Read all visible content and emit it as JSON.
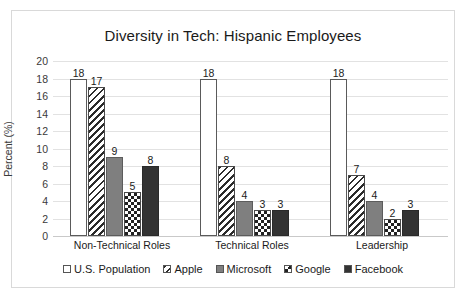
{
  "chart_data": {
    "type": "bar",
    "title": "Diversity in Tech: Hispanic Employees",
    "xlabel": "",
    "ylabel": "Percent (%)",
    "ylim": [
      0,
      20
    ],
    "ytick_step": 2,
    "yticks": [
      "20",
      "18",
      "16",
      "14",
      "12",
      "10",
      "8",
      "6",
      "4",
      "2",
      "0"
    ],
    "grid": true,
    "legend_position": "bottom",
    "categories": [
      "Non-Technical Roles",
      "Technical Roles",
      "Leadership"
    ],
    "series": [
      {
        "name": "U.S. Population",
        "values": [
          18,
          18,
          18
        ],
        "fill": "white",
        "color": "#ffffff"
      },
      {
        "name": "Apple",
        "values": [
          17,
          8,
          7
        ],
        "fill": "diagonal-hatch",
        "color": "#2b2b2b"
      },
      {
        "name": "Microsoft",
        "values": [
          9,
          4,
          4
        ],
        "fill": "solid-gray",
        "color": "#7f7f7f"
      },
      {
        "name": "Google",
        "values": [
          5,
          3,
          2
        ],
        "fill": "checkerboard",
        "color": "#222222"
      },
      {
        "name": "Facebook",
        "values": [
          8,
          3,
          3
        ],
        "fill": "solid-black",
        "color": "#333333"
      }
    ]
  }
}
